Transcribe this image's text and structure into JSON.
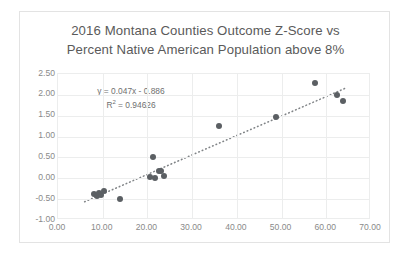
{
  "chart_data": {
    "type": "scatter",
    "title": "2016 Montana Counties Outcome Z-Score vs Percent Native American Population above 8%",
    "title_line1": "2016 Montana Counties Outcome Z-Score vs",
    "title_line2": "Percent Native American Population above 8%",
    "xlabel": "",
    "ylabel": "",
    "xlim": [
      0.0,
      70.0
    ],
    "ylim": [
      -1.0,
      2.5
    ],
    "xticks": [
      "0.00",
      "10.00",
      "20.00",
      "30.00",
      "40.00",
      "50.00",
      "60.00",
      "70.00"
    ],
    "xtick_values": [
      0,
      10,
      20,
      30,
      40,
      50,
      60,
      70
    ],
    "yticks": [
      "2.50",
      "2.00",
      "1.50",
      "1.00",
      "0.50",
      "0.00",
      "-0.50",
      "-1.00"
    ],
    "ytick_values": [
      2.5,
      2.0,
      1.5,
      1.0,
      0.5,
      0.0,
      -0.5,
      -1.0
    ],
    "grid": true,
    "legend": false,
    "point_color": "#5b5f63",
    "trendline_color": "#808487",
    "trendline_style": "dotted",
    "annotations": {
      "equation": "y = 0.047x - 0.886",
      "r_squared_prefix": "R",
      "r_squared_sup": "2",
      "r_squared_value": " = 0.94626",
      "r_squared_full": "R² = 0.94626"
    },
    "trendline": {
      "slope": 0.047,
      "intercept": -0.886,
      "r_squared": 0.94626,
      "x_start": 6.0,
      "x_end": 64.5
    },
    "points": [
      {
        "x": 8.0,
        "y": -0.38
      },
      {
        "x": 8.6,
        "y": -0.42
      },
      {
        "x": 9.2,
        "y": -0.34
      },
      {
        "x": 9.6,
        "y": -0.4
      },
      {
        "x": 10.2,
        "y": -0.31
      },
      {
        "x": 13.8,
        "y": -0.5
      },
      {
        "x": 20.6,
        "y": 0.04
      },
      {
        "x": 21.3,
        "y": 0.52
      },
      {
        "x": 21.6,
        "y": 0.02
      },
      {
        "x": 22.6,
        "y": 0.18
      },
      {
        "x": 23.0,
        "y": 0.18
      },
      {
        "x": 23.8,
        "y": 0.06
      },
      {
        "x": 36.0,
        "y": 1.25
      },
      {
        "x": 48.8,
        "y": 1.46
      },
      {
        "x": 57.4,
        "y": 2.28
      },
      {
        "x": 62.4,
        "y": 1.99
      },
      {
        "x": 63.8,
        "y": 1.86
      }
    ]
  }
}
